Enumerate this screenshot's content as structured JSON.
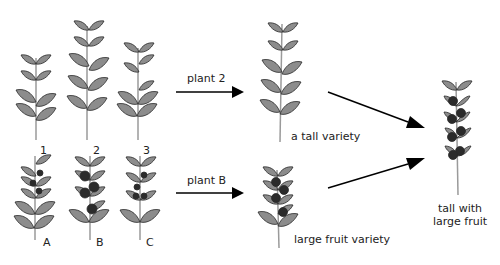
{
  "colors": {
    "leaf_fill": "#8c8c8c",
    "leaf_stroke": "#2a2a2a",
    "stem": "#9a9a9a",
    "fruit": "#2b2b2b",
    "arrow": "#000000",
    "text": "#222222"
  },
  "parents_tall": [
    {
      "label": "1"
    },
    {
      "label": "2"
    },
    {
      "label": "3"
    }
  ],
  "parents_fruit": [
    {
      "label": "A"
    },
    {
      "label": "B"
    },
    {
      "label": "C"
    }
  ],
  "arrows": {
    "top_label": "plant 2",
    "bottom_label": "plant B"
  },
  "varieties": {
    "tall": "a tall variety",
    "fruit": "large fruit variety"
  },
  "result": {
    "line1": "tall with",
    "line2": "large fruit"
  }
}
